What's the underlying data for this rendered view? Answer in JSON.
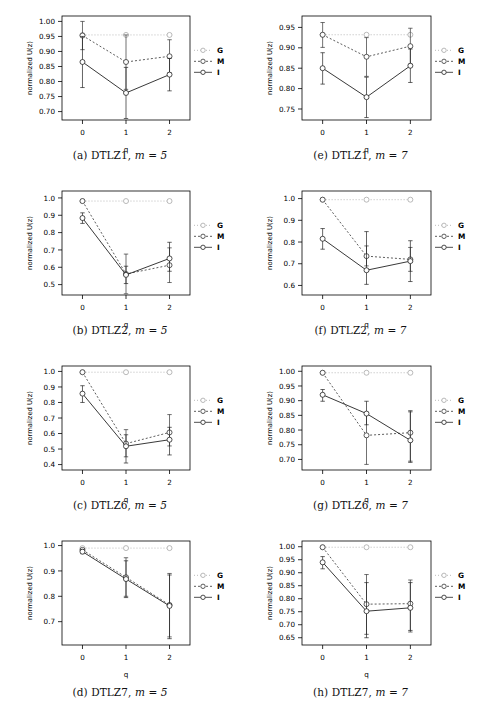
{
  "figure": {
    "background_color": "#ffffff",
    "axis_y_label": "normalized U(z)",
    "axis_x_label": "q",
    "x_tick_labels": [
      "0",
      "1",
      "2"
    ],
    "legend_entries": [
      "G",
      "M",
      "I"
    ],
    "series_styles": {
      "G": {
        "color": "#a8a8a8",
        "dash": "1,2",
        "name": "G"
      },
      "M": {
        "color": "#333333",
        "dash": "2,2",
        "name": "M"
      },
      "I": {
        "color": "#222222",
        "dash": "none",
        "name": "I"
      }
    }
  },
  "panels": [
    {
      "id": "a",
      "caption_label": "(a)",
      "caption_problem": "DTLZ1,",
      "caption_m": "m = 5",
      "chart_data": {
        "type": "line",
        "title": "DTLZ1, m = 5",
        "xlabel": "q",
        "ylabel": "normalized U(z)",
        "x": [
          0,
          1,
          2
        ],
        "categories": [
          "0",
          "1",
          "2"
        ],
        "yticks": [
          0.7,
          0.75,
          0.8,
          0.85,
          0.9,
          0.95,
          1.0
        ],
        "ytick_labels": [
          "0.70",
          "0.75",
          "0.80",
          "0.85",
          "0.90",
          "0.95",
          "1.00"
        ],
        "ylim": [
          0.672,
          1.018
        ],
        "grid": false,
        "legend_position": "right",
        "series": [
          {
            "name": "G",
            "values": [
              0.955,
              0.955,
              0.955
            ],
            "err_low": [
              0.955,
              0.955,
              0.955
            ],
            "err_high": [
              0.955,
              0.955,
              0.955
            ]
          },
          {
            "name": "M",
            "values": [
              0.953,
              0.865,
              0.884
            ],
            "err_low": [
              0.906,
              0.774,
              0.829
            ],
            "err_high": [
              1.0,
              0.955,
              0.939
            ]
          },
          {
            "name": "I",
            "values": [
              0.865,
              0.762,
              0.823
            ],
            "err_low": [
              0.78,
              0.677,
              0.769
            ],
            "err_high": [
              0.95,
              0.847,
              0.877
            ]
          }
        ]
      }
    },
    {
      "id": "e",
      "caption_label": "(e)",
      "caption_problem": "DTLZ1,",
      "caption_m": "m = 7",
      "chart_data": {
        "type": "line",
        "title": "DTLZ1, m = 7",
        "xlabel": "q",
        "ylabel": "normalized U(z)",
        "x": [
          0,
          1,
          2
        ],
        "categories": [
          "0",
          "1",
          "2"
        ],
        "yticks": [
          0.75,
          0.8,
          0.85,
          0.9,
          0.95
        ],
        "ytick_labels": [
          "0.75",
          "0.80",
          "0.85",
          "0.90",
          "0.95"
        ],
        "ylim": [
          0.723,
          0.978
        ],
        "grid": false,
        "legend_position": "right",
        "series": [
          {
            "name": "G",
            "values": [
              0.932,
              0.932,
              0.932
            ],
            "err_low": [
              0.932,
              0.932,
              0.932
            ],
            "err_high": [
              0.932,
              0.932,
              0.932
            ]
          },
          {
            "name": "M",
            "values": [
              0.932,
              0.878,
              0.904
            ],
            "err_low": [
              0.901,
              0.83,
              0.86
            ],
            "err_high": [
              0.962,
              0.925,
              0.948
            ]
          },
          {
            "name": "I",
            "values": [
              0.85,
              0.779,
              0.856
            ],
            "err_low": [
              0.811,
              0.729,
              0.815
            ],
            "err_high": [
              0.888,
              0.828,
              0.897
            ]
          }
        ]
      }
    },
    {
      "id": "b",
      "caption_label": "(b)",
      "caption_problem": "DTLZ2,",
      "caption_m": "m = 5",
      "chart_data": {
        "type": "line",
        "title": "DTLZ2, m = 5",
        "xlabel": "q",
        "ylabel": "normalized U(z)",
        "x": [
          0,
          1,
          2
        ],
        "categories": [
          "0",
          "1",
          "2"
        ],
        "yticks": [
          0.5,
          0.6,
          0.7,
          0.8,
          0.9,
          1.0
        ],
        "ytick_labels": [
          "0.5",
          "0.6",
          "0.7",
          "0.8",
          "0.9",
          "1.0"
        ],
        "ylim": [
          0.44,
          1.04
        ],
        "grid": false,
        "legend_position": "right",
        "series": [
          {
            "name": "G",
            "values": [
              0.982,
              0.982,
              0.982
            ],
            "err_low": [
              0.982,
              0.982,
              0.982
            ],
            "err_high": [
              0.982,
              0.982,
              0.982
            ]
          },
          {
            "name": "M",
            "values": [
              0.982,
              0.561,
              0.612
            ],
            "err_low": [
              0.982,
              0.447,
              0.512
            ],
            "err_high": [
              0.982,
              0.676,
              0.712
            ]
          },
          {
            "name": "I",
            "values": [
              0.884,
              0.556,
              0.651
            ],
            "err_low": [
              0.853,
              0.506,
              0.577
            ],
            "err_high": [
              0.914,
              0.606,
              0.744
            ]
          }
        ]
      }
    },
    {
      "id": "f",
      "caption_label": "(f)",
      "caption_problem": "DTLZ2,",
      "caption_m": "m = 7",
      "chart_data": {
        "type": "line",
        "title": "DTLZ2, m = 7",
        "xlabel": "q",
        "ylabel": "normalized U(z)",
        "x": [
          0,
          1,
          2
        ],
        "categories": [
          "0",
          "1",
          "2"
        ],
        "yticks": [
          0.6,
          0.7,
          0.8,
          0.9,
          1.0
        ],
        "ytick_labels": [
          "0.6",
          "0.7",
          "0.8",
          "0.9",
          "1.0"
        ],
        "ylim": [
          0.556,
          1.035
        ],
        "grid": false,
        "legend_position": "right",
        "series": [
          {
            "name": "G",
            "values": [
              0.995,
              0.995,
              0.995
            ],
            "err_low": [
              0.995,
              0.995,
              0.995
            ],
            "err_high": [
              0.995,
              0.995,
              0.995
            ]
          },
          {
            "name": "M",
            "values": [
              0.995,
              0.735,
              0.72
            ],
            "err_low": [
              0.995,
              0.69,
              0.665
            ],
            "err_high": [
              0.995,
              0.782,
              0.775
            ]
          },
          {
            "name": "I",
            "values": [
              0.815,
              0.67,
              0.712
            ],
            "err_low": [
              0.767,
              0.605,
              0.618
            ],
            "err_high": [
              0.862,
              0.848,
              0.806
            ]
          }
        ]
      }
    },
    {
      "id": "c",
      "caption_label": "(c)",
      "caption_problem": "DTLZ6,",
      "caption_m": "m = 5",
      "chart_data": {
        "type": "line",
        "title": "DTLZ6, m = 5",
        "xlabel": "q",
        "ylabel": "normalized U(z)",
        "x": [
          0,
          1,
          2
        ],
        "categories": [
          "0",
          "1",
          "2"
        ],
        "yticks": [
          0.4,
          0.5,
          0.6,
          0.7,
          0.8,
          0.9,
          1.0
        ],
        "ytick_labels": [
          "0.4",
          "0.5",
          "0.6",
          "0.7",
          "0.8",
          "0.9",
          "1.0"
        ],
        "ylim": [
          0.365,
          1.035
        ],
        "grid": false,
        "legend_position": "right",
        "series": [
          {
            "name": "G",
            "values": [
              0.995,
              0.995,
              0.995
            ],
            "err_low": [
              0.995,
              0.995,
              0.995
            ],
            "err_high": [
              0.995,
              0.995,
              0.995
            ]
          },
          {
            "name": "M",
            "values": [
              0.995,
              0.535,
              0.607
            ],
            "err_low": [
              0.995,
              0.45,
              0.52
            ],
            "err_high": [
              0.995,
              0.625,
              0.722
            ]
          },
          {
            "name": "I",
            "values": [
              0.857,
              0.518,
              0.56
            ],
            "err_low": [
              0.8,
              0.41,
              0.462
            ],
            "err_high": [
              0.908,
              0.592,
              0.64
            ]
          }
        ]
      }
    },
    {
      "id": "g",
      "caption_label": "(g)",
      "caption_problem": "DTLZ6,",
      "caption_m": "m = 7",
      "chart_data": {
        "type": "line",
        "title": "DTLZ6, m = 7",
        "xlabel": "q",
        "ylabel": "normalized U(z)",
        "x": [
          0,
          1,
          2
        ],
        "categories": [
          "0",
          "1",
          "2"
        ],
        "yticks": [
          0.7,
          0.75,
          0.8,
          0.85,
          0.9,
          0.95,
          1.0
        ],
        "ytick_labels": [
          "0.70",
          "0.75",
          "0.80",
          "0.85",
          "0.90",
          "0.95",
          "1.00"
        ],
        "ylim": [
          0.664,
          1.018
        ],
        "grid": false,
        "legend_position": "right",
        "series": [
          {
            "name": "G",
            "values": [
              0.995,
              0.995,
              0.995
            ],
            "err_low": [
              0.995,
              0.995,
              0.995
            ],
            "err_high": [
              0.995,
              0.995,
              0.995
            ]
          },
          {
            "name": "M",
            "values": [
              0.995,
              0.782,
              0.791
            ],
            "err_low": [
              0.995,
              0.683,
              0.694
            ],
            "err_high": [
              0.995,
              0.86,
              0.866
            ]
          },
          {
            "name": "I",
            "values": [
              0.92,
              0.856,
              0.765
            ],
            "err_low": [
              0.898,
              0.818,
              0.69
            ],
            "err_high": [
              0.938,
              0.898,
              0.862
            ]
          }
        ]
      }
    },
    {
      "id": "d",
      "caption_label": "(d)",
      "caption_problem": "DTLZ7,",
      "caption_m": "m = 5",
      "chart_data": {
        "type": "line",
        "title": "DTLZ7, m = 5",
        "xlabel": "q",
        "ylabel": "normalized U(z)",
        "x": [
          0,
          1,
          2
        ],
        "categories": [
          "0",
          "1",
          "2"
        ],
        "yticks": [
          0.7,
          0.8,
          0.9,
          1.0
        ],
        "ytick_labels": [
          "0.7",
          "0.8",
          "0.9",
          "1.0"
        ],
        "ylim": [
          0.608,
          1.018
        ],
        "grid": false,
        "legend_position": "right",
        "series": [
          {
            "name": "G",
            "values": [
              0.99,
              0.99,
              0.99
            ],
            "err_low": [
              0.99,
              0.99,
              0.99
            ],
            "err_high": [
              0.99,
              0.99,
              0.99
            ]
          },
          {
            "name": "M",
            "values": [
              0.983,
              0.875,
              0.766
            ],
            "err_low": [
              0.983,
              0.8,
              0.64
            ],
            "err_high": [
              0.983,
              0.952,
              0.89
            ]
          },
          {
            "name": "I",
            "values": [
              0.976,
              0.868,
              0.762
            ],
            "err_low": [
              0.968,
              0.795,
              0.633
            ],
            "err_high": [
              0.984,
              0.94,
              0.884
            ]
          }
        ]
      }
    },
    {
      "id": "h",
      "caption_label": "(h)",
      "caption_problem": "DTLZ7,",
      "caption_m": "m = 7",
      "chart_data": {
        "type": "line",
        "title": "DTLZ7, m = 7",
        "xlabel": "q",
        "ylabel": "normalized U(z)",
        "x": [
          0,
          1,
          2
        ],
        "categories": [
          "0",
          "1",
          "2"
        ],
        "yticks": [
          0.65,
          0.7,
          0.75,
          0.8,
          0.85,
          0.9,
          0.95,
          1.0
        ],
        "ytick_labels": [
          "0.65",
          "0.70",
          "0.75",
          "0.80",
          "0.85",
          "0.90",
          "0.95",
          "1.00"
        ],
        "ylim": [
          0.622,
          1.022
        ],
        "grid": false,
        "legend_position": "right",
        "series": [
          {
            "name": "G",
            "values": [
              0.998,
              0.998,
              0.998
            ],
            "err_low": [
              0.998,
              0.998,
              0.998
            ],
            "err_high": [
              0.998,
              0.998,
              0.998
            ]
          },
          {
            "name": "M",
            "values": [
              0.998,
              0.779,
              0.781
            ],
            "err_low": [
              0.998,
              0.663,
              0.672
            ],
            "err_high": [
              0.998,
              0.893,
              0.872
            ]
          },
          {
            "name": "I",
            "values": [
              0.94,
              0.752,
              0.765
            ],
            "err_low": [
              0.915,
              0.65,
              0.678
            ],
            "err_high": [
              0.962,
              0.862,
              0.862
            ]
          }
        ]
      }
    }
  ]
}
